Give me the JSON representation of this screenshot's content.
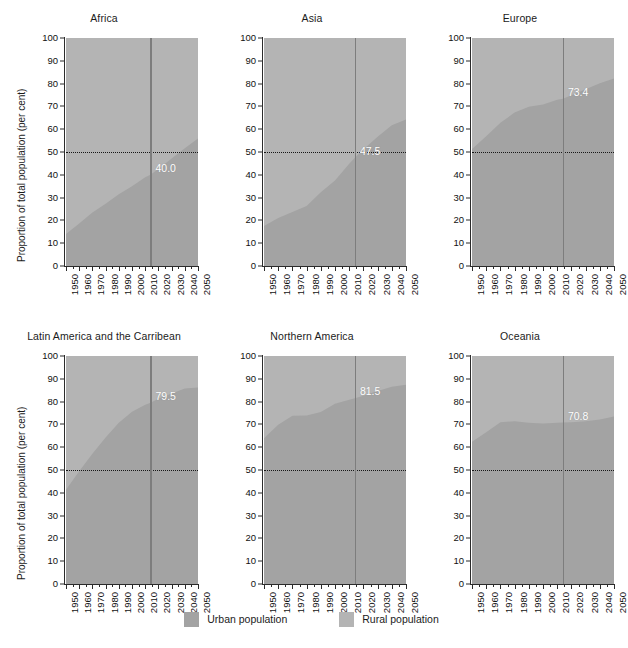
{
  "figure": {
    "ylabel": "Proportion of total population (per cent)",
    "caption": "",
    "reference_year": 2014,
    "colors": {
      "urban": "#a3a3a3",
      "rural": "#b4b4b4",
      "axis": "#2b2b2b",
      "fifty_line": "#171717",
      "vline": "#7d7d7d",
      "value_text": "#ffffff"
    }
  },
  "legend": {
    "position": "bottom-center",
    "items": [
      {
        "label": "Urban population",
        "color": "#a3a3a3",
        "swatch": "urban-swatch"
      },
      {
        "label": "Rural population",
        "color": "#b4b4b4",
        "swatch": "rural-swatch"
      }
    ]
  },
  "axes": {
    "y_ticks": [
      0,
      10,
      20,
      30,
      40,
      50,
      60,
      70,
      80,
      90,
      100
    ],
    "ylim": [
      0,
      100
    ],
    "x_ticks": [
      1950,
      1960,
      1970,
      1980,
      1990,
      2000,
      2010,
      2020,
      2030,
      2040,
      2050
    ],
    "xlim": [
      1950,
      2050
    ]
  },
  "chart_data": {
    "type": "area",
    "title": "",
    "xlabel": "",
    "ylabel": "Proportion of total population (per cent)",
    "ylim": [
      0,
      100
    ],
    "xlim": [
      1950,
      2050
    ],
    "grid": false,
    "legend": [
      "Urban population",
      "Rural population"
    ],
    "legend_position": "bottom-center",
    "annotations": [
      {
        "text": "50 per cent reference line",
        "type": "dotted-horizontal",
        "y": 50
      },
      {
        "text": "2014 reference line",
        "type": "vertical",
        "x": 2014
      }
    ],
    "x": [
      1950,
      1960,
      1970,
      1980,
      1990,
      2000,
      2010,
      2014,
      2020,
      2030,
      2040,
      2050
    ],
    "panels": [
      {
        "name": "Africa",
        "value_label": "40.0",
        "value_label_year": 2014,
        "series": [
          {
            "name": "Urban population",
            "values": [
              14.0,
              18.6,
              23.5,
              27.3,
              31.5,
              35.0,
              38.9,
              40.0,
              42.5,
              47.1,
              51.6,
              55.9
            ]
          },
          {
            "name": "Rural population",
            "values": [
              86.0,
              81.4,
              76.5,
              72.7,
              68.5,
              65.0,
              61.1,
              60.0,
              57.5,
              52.9,
              48.4,
              44.1
            ]
          }
        ]
      },
      {
        "name": "Asia",
        "value_label": "47.5",
        "value_label_year": 2014,
        "series": [
          {
            "name": "Urban population",
            "values": [
              17.5,
              21.0,
              23.7,
              26.3,
              32.3,
              37.5,
              44.8,
              47.5,
              51.1,
              56.7,
              61.7,
              64.2
            ]
          },
          {
            "name": "Rural population",
            "values": [
              82.5,
              79.0,
              76.3,
              73.7,
              67.7,
              62.5,
              55.2,
              52.5,
              48.9,
              43.3,
              38.3,
              35.8
            ]
          }
        ]
      },
      {
        "name": "Europe",
        "value_label": "73.4",
        "value_label_year": 2014,
        "series": [
          {
            "name": "Urban population",
            "values": [
              51.3,
              56.9,
              62.8,
              67.3,
              69.8,
              70.8,
              72.9,
              73.4,
              74.9,
              77.5,
              80.2,
              82.2
            ]
          },
          {
            "name": "Rural population",
            "values": [
              48.7,
              43.1,
              37.2,
              32.7,
              30.2,
              29.2,
              27.1,
              26.6,
              25.1,
              22.5,
              19.8,
              17.8
            ]
          }
        ]
      },
      {
        "name": "Latin America and the Carribean",
        "value_label": "79.5",
        "value_label_year": 2014,
        "series": [
          {
            "name": "Urban population",
            "values": [
              41.3,
              49.4,
              57.1,
              64.3,
              70.7,
              75.5,
              78.6,
              79.5,
              81.2,
              83.6,
              85.8,
              86.2
            ]
          },
          {
            "name": "Rural population",
            "values": [
              58.7,
              50.6,
              42.9,
              35.7,
              29.3,
              24.5,
              21.4,
              20.5,
              18.8,
              16.4,
              14.2,
              13.8
            ]
          }
        ]
      },
      {
        "name": "Northern America",
        "value_label": "81.5",
        "value_label_year": 2014,
        "series": [
          {
            "name": "Urban population",
            "values": [
              63.9,
              69.9,
              73.8,
              73.9,
              75.4,
              79.1,
              80.8,
              81.5,
              82.6,
              84.7,
              86.5,
              87.4
            ]
          },
          {
            "name": "Rural population",
            "values": [
              36.1,
              30.1,
              26.2,
              26.1,
              24.6,
              20.9,
              19.2,
              18.5,
              17.4,
              15.3,
              13.5,
              12.6
            ]
          }
        ]
      },
      {
        "name": "Oceania",
        "value_label": "70.8",
        "value_label_year": 2014,
        "series": [
          {
            "name": "Urban population",
            "values": [
              62.4,
              66.6,
              70.9,
              71.4,
              70.7,
              70.4,
              70.7,
              70.8,
              70.9,
              71.4,
              72.1,
              73.5
            ]
          },
          {
            "name": "Rural population",
            "values": [
              37.6,
              33.4,
              29.1,
              28.6,
              29.3,
              29.6,
              29.3,
              29.2,
              29.1,
              28.6,
              27.9,
              26.5
            ]
          }
        ]
      }
    ]
  }
}
